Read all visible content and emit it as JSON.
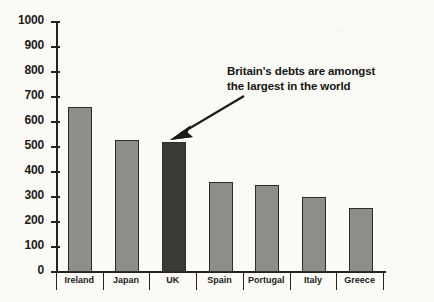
{
  "chart_data": {
    "type": "bar",
    "title": "",
    "xlabel": "",
    "ylabel": "",
    "ylim": [
      0,
      1000
    ],
    "grid": false,
    "legend": "none",
    "categories": [
      "Ireland",
      "Japan",
      "UK",
      "Spain",
      "Portugal",
      "Italy",
      "Greece"
    ],
    "values": [
      660,
      530,
      520,
      360,
      350,
      300,
      255
    ],
    "y_ticks": [
      1000,
      900,
      800,
      700,
      600,
      500,
      400,
      300,
      200,
      100,
      0
    ],
    "bar_colors": [
      "#8d8d8a",
      "#8d8d8a",
      "#3a3a38",
      "#8d8d8a",
      "#8d8d8a",
      "#8d8d8a",
      "#8d8d8a"
    ],
    "highlight_category": "UK",
    "annotations": [
      {
        "name": "britain-debts-callout",
        "lines": [
          "Britain's debts are amongst",
          "the largest in the world"
        ],
        "points_to": "UK"
      }
    ]
  },
  "colors": {
    "bar_default": "#8d8d8a",
    "bar_highlight": "#3a3a38",
    "axis": "#24241f",
    "text": "#1b1b18",
    "background": "#fbfaf7"
  }
}
